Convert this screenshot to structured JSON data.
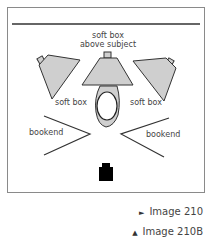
{
  "diagram": {
    "labels": {
      "top_softbox_line1": "soft box",
      "top_softbox_line2": "above subject",
      "left_softbox": "soft box",
      "right_softbox": "soft box",
      "left_bookend": "bookend",
      "right_bookend": "bookend"
    },
    "colors": {
      "softbox_fill": "#cfcfcf",
      "stroke": "#333333",
      "camera": "#000000",
      "frame_border": "#8a8a8a"
    }
  },
  "captions": [
    {
      "marker": "►",
      "text": "Image 210"
    },
    {
      "marker": "▲",
      "text": "Image 210B"
    }
  ]
}
